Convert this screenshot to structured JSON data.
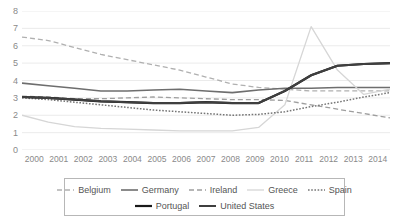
{
  "chart_data": {
    "type": "line",
    "title": "",
    "xlabel": "",
    "ylabel": "",
    "x": [
      2000,
      2001,
      2002,
      2003,
      2004,
      2005,
      2006,
      2007,
      2008,
      2009,
      2010,
      2011,
      2012,
      2013,
      2014
    ],
    "categories": [
      "2000",
      "2001",
      "2002",
      "2003",
      "2004",
      "2005",
      "2006",
      "2007",
      "2008",
      "2009",
      "2010",
      "2011",
      "2012",
      "2013",
      "2014"
    ],
    "xlim": [
      2000,
      2014
    ],
    "ylim": [
      0,
      8
    ],
    "yticks": [
      0,
      1,
      2,
      3,
      4,
      5,
      6,
      7,
      8
    ],
    "ytick_labels": [
      "0",
      "1",
      "2",
      "3",
      "4",
      "5",
      "6",
      "7",
      "8"
    ],
    "grid": true,
    "grid_axis": "y",
    "legend_position": "bottom",
    "series": [
      {
        "name": "Belgium",
        "style": "dashed",
        "color": "#b0b0b0",
        "width": 1.3,
        "values": [
          6.5,
          6.3,
          5.9,
          5.5,
          5.2,
          4.9,
          4.6,
          4.2,
          3.8,
          3.6,
          3.5,
          3.4,
          3.4,
          3.4,
          3.4
        ]
      },
      {
        "name": "Germany",
        "style": "solid",
        "color": "#6e6e6e",
        "width": 1.6,
        "values": [
          3.85,
          3.7,
          3.55,
          3.4,
          3.4,
          3.45,
          3.5,
          3.4,
          3.3,
          3.45,
          3.55,
          3.55,
          3.6,
          3.6,
          3.6
        ]
      },
      {
        "name": "Ireland",
        "style": "dashed",
        "color": "#9e9e9e",
        "width": 1.3,
        "values": [
          3.1,
          3.05,
          2.95,
          2.95,
          3.0,
          3.05,
          3.0,
          2.95,
          2.9,
          2.9,
          2.85,
          2.6,
          2.35,
          2.1,
          1.85
        ]
      },
      {
        "name": "Greece",
        "style": "solid",
        "color": "#d6d6d6",
        "width": 1.3,
        "values": [
          2.0,
          1.6,
          1.35,
          1.25,
          1.2,
          1.15,
          1.1,
          1.1,
          1.1,
          1.3,
          2.6,
          7.1,
          4.6,
          3.2,
          3.5
        ]
      },
      {
        "name": "Spain",
        "style": "dotted",
        "color": "#757575",
        "width": 1.5,
        "values": [
          3.0,
          2.9,
          2.75,
          2.6,
          2.45,
          2.3,
          2.2,
          2.1,
          2.0,
          2.05,
          2.2,
          2.5,
          2.75,
          3.05,
          3.3
        ]
      },
      {
        "name": "Portugal",
        "style": "solid",
        "color": "#1a1a1a",
        "width": 2.2,
        "values": [
          3.05,
          3.0,
          2.9,
          2.8,
          2.75,
          2.7,
          2.7,
          2.75,
          2.7,
          2.7,
          3.4,
          4.3,
          4.85,
          4.95,
          5.0
        ]
      },
      {
        "name": "United States",
        "style": "solid",
        "color": "#3f3f3f",
        "width": 2.0,
        "values": [
          3.05,
          3.0,
          2.9,
          2.8,
          2.75,
          2.7,
          2.7,
          2.75,
          2.7,
          2.7,
          3.4,
          4.3,
          4.85,
          4.95,
          5.0
        ]
      }
    ]
  },
  "legend": {
    "row1": [
      {
        "label": "Belgium"
      },
      {
        "label": "Germany"
      },
      {
        "label": "Ireland"
      },
      {
        "label": "Greece"
      },
      {
        "label": "Spain"
      }
    ],
    "row2": [
      {
        "label": "Portugal"
      },
      {
        "label": "United States"
      }
    ]
  },
  "colors": {
    "grid": "#e6e6e6",
    "axis_text": "#8a8a8a",
    "legend_border": "#b7b7b7",
    "legend_text": "#555555",
    "background": "#ffffff"
  }
}
